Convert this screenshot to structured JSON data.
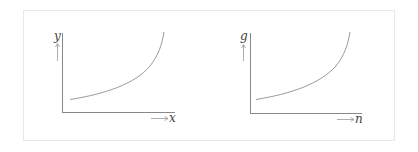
{
  "graphs": [
    {
      "id": "left",
      "y_label": "y",
      "x_label": "x",
      "curve": "increasing-convex"
    },
    {
      "id": "right",
      "y_label": "g",
      "x_label": "n",
      "curve": "increasing-convex"
    }
  ],
  "colors": {
    "axis": "#888888",
    "curve": "#9a9a9a",
    "frame": "#e8e8e8",
    "text": "#444444"
  }
}
